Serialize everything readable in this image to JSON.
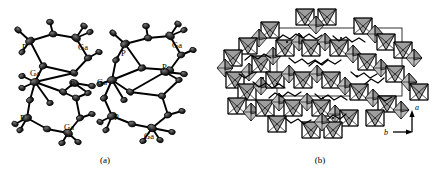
{
  "figure": {
    "panels": [
      {
        "id": "a",
        "caption": "(a)",
        "type": "ortep-molecular-structure",
        "description": "Thermal ellipsoid plot of two gallophosphate cluster fragments",
        "molecules": [
          {
            "id": "left",
            "atom_labels": [
              {
                "text": "P",
                "x": 22,
                "y": 47
              },
              {
                "text": "Ga",
                "x": 78,
                "y": 47
              },
              {
                "text": "Ga",
                "x": 32,
                "y": 73
              },
              {
                "text": "P",
                "x": 70,
                "y": 84
              },
              {
                "text": "P",
                "x": 22,
                "y": 118
              },
              {
                "text": "Ga",
                "x": 65,
                "y": 127
              }
            ]
          },
          {
            "id": "right",
            "atom_labels": [
              {
                "text": "P",
                "x": 120,
                "y": 52
              },
              {
                "text": "Ga",
                "x": 166,
                "y": 45
              },
              {
                "text": "Ga",
                "x": 104,
                "y": 84
              },
              {
                "text": "P",
                "x": 160,
                "y": 70
              },
              {
                "text": "P",
                "x": 117,
                "y": 117
              },
              {
                "text": "Ga",
                "x": 148,
                "y": 134
              }
            ]
          }
        ]
      },
      {
        "id": "b",
        "caption": "(b)",
        "type": "polyhedral-framework-packing",
        "description": "Polyhedral representation of the framework viewed down the c axis showing channels occupied by organic template chains",
        "axes": [
          {
            "label": "a",
            "direction": "up",
            "x": 408,
            "y": 122
          },
          {
            "label": "b",
            "direction": "right",
            "x": 381,
            "y": 141
          }
        ],
        "unit_cell": {
          "visible": true
        }
      }
    ]
  },
  "colors": {
    "background": "#ffffff",
    "ink": "#000000",
    "polyhedron_fill": "#9a9a9a",
    "polyhedron_fill_light": "#c8c8c8",
    "ellipsoid_fill": "#2b2b2b"
  }
}
